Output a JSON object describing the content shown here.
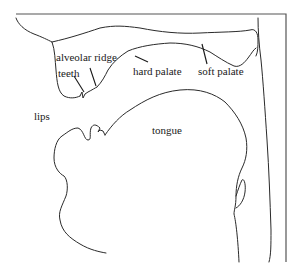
{
  "diagram": {
    "title": "",
    "type": "vocal tract sagittal section",
    "line_color": "#2a2a2a",
    "background": "#ffffff",
    "labels": [
      {
        "id": "alveolar-ridge",
        "text": "alveolar ridge",
        "x": 56,
        "y": 52
      },
      {
        "id": "teeth",
        "text": "teeth",
        "x": 58,
        "y": 67
      },
      {
        "id": "hard-palate",
        "text": "hard palate",
        "x": 133,
        "y": 66
      },
      {
        "id": "soft-palate",
        "text": "soft palate",
        "x": 198,
        "y": 66
      },
      {
        "id": "lips",
        "text": "lips",
        "x": 34,
        "y": 111
      },
      {
        "id": "tongue",
        "text": "tongue",
        "x": 152,
        "y": 127
      }
    ]
  }
}
